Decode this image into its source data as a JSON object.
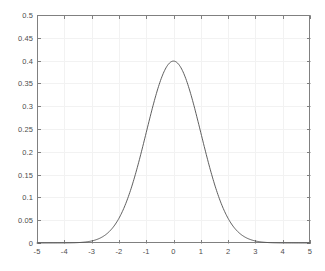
{
  "chart_data": {
    "type": "line",
    "title": "",
    "subtitle": "",
    "xlabel": "",
    "ylabel": "",
    "xlim": [
      -5,
      5
    ],
    "ylim": [
      0,
      0.5
    ],
    "xticks": [
      -5,
      -4,
      -3,
      -2,
      -1,
      0,
      1,
      2,
      3,
      4,
      5
    ],
    "xtick_labels": [
      "-5",
      "-4",
      "-3",
      "-2",
      "-1",
      "0",
      "1",
      "2",
      "3",
      "4",
      "5"
    ],
    "yticks": [
      0,
      0.05,
      0.1,
      0.15,
      0.2,
      0.25,
      0.3,
      0.35,
      0.4,
      0.45,
      0.5
    ],
    "ytick_labels": [
      "0",
      "0.05",
      "0.1",
      "0.15",
      "0.2",
      "0.25",
      "0.3",
      "0.35",
      "0.4",
      "0.45",
      "0.5"
    ],
    "grid": true,
    "grid_color": "#f2f2f2",
    "axis_color": "#808080",
    "background_color": "#ffffff",
    "legend": null,
    "legend_position": "none",
    "annotations": [],
    "series": [
      {
        "name": "standard normal pdf",
        "color": "#4d4d4d",
        "line_width": 0.9,
        "marker": "none",
        "x": [
          -5,
          -4.8,
          -4.6,
          -4.4,
          -4.2,
          -4,
          -3.8,
          -3.6,
          -3.4,
          -3.2,
          -3,
          -2.8,
          -2.6,
          -2.4,
          -2.2,
          -2,
          -1.8,
          -1.6,
          -1.4,
          -1.2,
          -1,
          -0.8,
          -0.6,
          -0.4,
          -0.2,
          0,
          0.2,
          0.4,
          0.6,
          0.8,
          1,
          1.2,
          1.4,
          1.6,
          1.8,
          2,
          2.2,
          2.4,
          2.6,
          2.8,
          3,
          3.2,
          3.4,
          3.6,
          3.8,
          4,
          4.2,
          4.4,
          4.6,
          4.8,
          5
        ],
        "y": [
          1.5e-06,
          3.9e-06,
          1.02e-05,
          2.49e-05,
          5.89e-05,
          0.0001338,
          0.0002919,
          0.0006119,
          0.0012322,
          0.0023841,
          0.0044318,
          0.0079155,
          0.013583,
          0.0223945,
          0.0354746,
          0.053991,
          0.0789502,
          0.1109208,
          0.1497275,
          0.1941861,
          0.2419707,
          0.2896916,
          0.3332246,
          0.3682701,
          0.3910427,
          0.3989423,
          0.3910427,
          0.3682701,
          0.3332246,
          0.2896916,
          0.2419707,
          0.1941861,
          0.1497275,
          0.1109208,
          0.0789502,
          0.053991,
          0.0354746,
          0.0223945,
          0.013583,
          0.0079155,
          0.0044318,
          0.0023841,
          0.0012322,
          0.0006119,
          0.0002919,
          0.0001338,
          5.89e-05,
          2.49e-05,
          1.02e-05,
          3.9e-06,
          1.5e-06
        ]
      }
    ],
    "peak_value": 0.3989,
    "peak_x": 0
  },
  "plot_box": {
    "left": 37,
    "top": 15,
    "right": 310,
    "bottom": 243
  }
}
